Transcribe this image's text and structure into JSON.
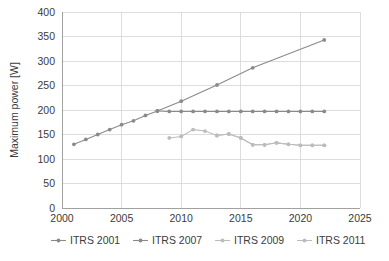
{
  "chart_data": {
    "type": "line",
    "title": "",
    "xlabel": "",
    "ylabel": "Maximum power [W]",
    "xlim": [
      2000,
      2025
    ],
    "ylim": [
      0,
      400
    ],
    "xticks": [
      2000,
      2005,
      2010,
      2015,
      2020,
      2025
    ],
    "yticks": [
      0,
      50,
      100,
      150,
      200,
      250,
      300,
      350,
      400
    ],
    "grid": true,
    "legend_position": "bottom",
    "series": [
      {
        "name": "ITRS 2001",
        "color": "#8a8a8a",
        "x": [
          2001,
          2002,
          2003,
          2004,
          2005,
          2006,
          2007,
          2008,
          2010,
          2013,
          2016,
          2022
        ],
        "values": [
          130,
          140,
          150,
          160,
          170,
          178,
          189,
          198,
          218,
          251,
          286,
          343
        ]
      },
      {
        "name": "ITRS 2007",
        "color": "#8a8a8a",
        "x": [
          2008,
          2009,
          2010,
          2011,
          2012,
          2013,
          2014,
          2015,
          2016,
          2017,
          2018,
          2019,
          2020,
          2021,
          2022
        ],
        "values": [
          198,
          197,
          197,
          197,
          197,
          197,
          197,
          197,
          197,
          197,
          197,
          197,
          197,
          197,
          197
        ]
      },
      {
        "name": "ITRS 2009",
        "color": "#bcbcbc",
        "x": [
          2009,
          2010,
          2011,
          2012,
          2013,
          2014,
          2015,
          2016,
          2017,
          2018,
          2019,
          2020,
          2021,
          2022
        ],
        "values": [
          143,
          146,
          160,
          157,
          148,
          151,
          143,
          129,
          129,
          133,
          130,
          128,
          128,
          128
        ]
      },
      {
        "name": "ITRS 2011",
        "color": "#bcbcbc",
        "x": [
          2013,
          2014,
          2015,
          2016,
          2017,
          2018,
          2019,
          2020,
          2021,
          2022
        ],
        "values": [
          148,
          151,
          143,
          129,
          129,
          133,
          130,
          128,
          128,
          128
        ]
      }
    ],
    "legend": [
      {
        "label": "ITRS 2001",
        "color": "#8a8a8a"
      },
      {
        "label": "ITRS 2007",
        "color": "#8a8a8a"
      },
      {
        "label": "ITRS 2009",
        "color": "#bcbcbc"
      },
      {
        "label": "ITRS 2011",
        "color": "#bcbcbc"
      }
    ]
  }
}
